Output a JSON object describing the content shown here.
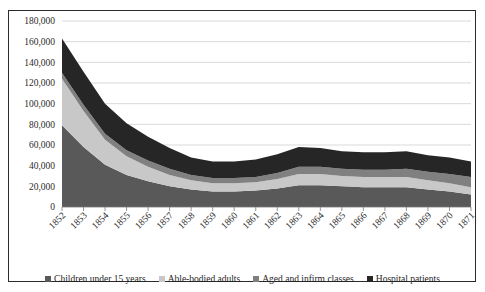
{
  "chart_data": {
    "type": "area",
    "title": "",
    "subtitle": "",
    "xlabel": "",
    "ylabel": "",
    "stacked": true,
    "grid": true,
    "legend_position": "bottom",
    "ylim": [
      0,
      180000
    ],
    "yticks": [
      "0",
      "20,000",
      "40,000",
      "60,000",
      "80,000",
      "100,000",
      "120,000",
      "140,000",
      "160,000",
      "180,000"
    ],
    "ytick_values": [
      0,
      20000,
      40000,
      60000,
      80000,
      100000,
      120000,
      140000,
      160000,
      180000
    ],
    "categories": [
      "1852",
      "1853",
      "1854",
      "1855",
      "1856",
      "1857",
      "1858",
      "1859",
      "1860",
      "1861",
      "1862",
      "1863",
      "1864",
      "1865",
      "1866",
      "1867",
      "1868",
      "1869",
      "1870",
      "1871"
    ],
    "series": [
      {
        "name": "Children under 15 years",
        "color": "#595959",
        "values": [
          79000,
          58000,
          41000,
          31000,
          25000,
          20000,
          17000,
          15000,
          15000,
          16000,
          18000,
          21000,
          21000,
          20000,
          19000,
          19000,
          19000,
          17000,
          15000,
          12000
        ]
      },
      {
        "name": "Able-bodied adults",
        "color": "#c8c8c8",
        "values": [
          45000,
          35000,
          24000,
          18000,
          14000,
          11000,
          9000,
          8000,
          8000,
          8000,
          9000,
          11000,
          11000,
          10000,
          10000,
          10000,
          10000,
          9000,
          8000,
          7000
        ]
      },
      {
        "name": "Aged and infirm classes",
        "color": "#808080",
        "values": [
          6000,
          6000,
          6000,
          6000,
          6000,
          6000,
          5000,
          5000,
          5000,
          5000,
          6000,
          7000,
          7000,
          7000,
          7000,
          7000,
          8000,
          8000,
          9000,
          10000
        ]
      },
      {
        "name": "Hospital patients",
        "color": "#262626",
        "values": [
          33000,
          32000,
          29000,
          26000,
          23000,
          20000,
          17000,
          16000,
          16000,
          17000,
          18000,
          19000,
          18000,
          17000,
          17000,
          17000,
          17000,
          16000,
          16000,
          15000
        ]
      }
    ]
  },
  "legend": {
    "items": [
      {
        "label": "Children under 15 years",
        "color": "#595959"
      },
      {
        "label": "Able-bodied adults",
        "color": "#c8c8c8"
      },
      {
        "label": "Aged and infirm classes",
        "color": "#808080"
      },
      {
        "label": "Hospital patients",
        "color": "#262626"
      }
    ]
  }
}
